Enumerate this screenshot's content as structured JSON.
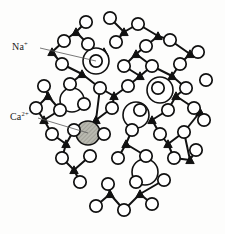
{
  "figure": {
    "type": "structure-diagram",
    "background_color": "#fdfdfc",
    "line_color": "#111111",
    "atom_fill": "#ffffff"
  },
  "labels": [
    {
      "id": "na",
      "text": "Na",
      "charge": "+",
      "full": "Na+",
      "leader_from": [
        40,
        48
      ],
      "leader_to": [
        96,
        61
      ]
    },
    {
      "id": "ca",
      "text": "Ca",
      "charge": "2+",
      "full": "Ca2+",
      "leader_from": [
        38,
        118
      ],
      "leader_to": [
        88,
        133
      ]
    }
  ],
  "legend_species": {
    "oxygen_label": "oxygen",
    "silicon_label": "silicon",
    "sodium_label": "sodium ion",
    "calcium_label": "calcium ion"
  },
  "colors": {
    "sodium_ion_fill": "#ffffff",
    "calcium_ion_fill": "#b9b9b0",
    "silicon_fill": "#111111",
    "oxygen_stroke": "#111111"
  },
  "chart_data": {
    "type": "scatter",
    "title": "",
    "xlabel": "",
    "ylabel": "",
    "oxygen_atoms": [
      [
        86,
        22
      ],
      [
        110,
        18
      ],
      [
        138,
        24
      ],
      [
        64,
        41
      ],
      [
        88,
        44
      ],
      [
        116,
        42
      ],
      [
        146,
        46
      ],
      [
        170,
        40
      ],
      [
        62,
        64
      ],
      [
        96,
        61
      ],
      [
        124,
        66
      ],
      [
        152,
        66
      ],
      [
        180,
        64
      ],
      [
        198,
        52
      ],
      [
        44,
        86
      ],
      [
        70,
        84
      ],
      [
        100,
        88
      ],
      [
        128,
        86
      ],
      [
        158,
        88
      ],
      [
        186,
        88
      ],
      [
        206,
        80
      ],
      [
        36,
        108
      ],
      [
        60,
        110
      ],
      [
        84,
        104
      ],
      [
        112,
        108
      ],
      [
        140,
        110
      ],
      [
        168,
        110
      ],
      [
        194,
        108
      ],
      [
        52,
        134
      ],
      [
        74,
        130
      ],
      [
        104,
        134
      ],
      [
        132,
        130
      ],
      [
        160,
        134
      ],
      [
        184,
        132
      ],
      [
        204,
        120
      ],
      [
        62,
        158
      ],
      [
        90,
        156
      ],
      [
        118,
        158
      ],
      [
        146,
        156
      ],
      [
        174,
        158
      ],
      [
        196,
        150
      ],
      [
        80,
        182
      ],
      [
        108,
        184
      ],
      [
        136,
        182
      ],
      [
        164,
        180
      ],
      [
        96,
        206
      ],
      [
        124,
        210
      ],
      [
        152,
        204
      ]
    ],
    "silicon_nodes": [
      [
        76,
        32
      ],
      [
        124,
        32
      ],
      [
        158,
        36
      ],
      [
        52,
        52
      ],
      [
        104,
        52
      ],
      [
        136,
        54
      ],
      [
        190,
        54
      ],
      [
        82,
        74
      ],
      [
        140,
        76
      ],
      [
        172,
        76
      ],
      [
        48,
        96
      ],
      [
        114,
        96
      ],
      [
        176,
        96
      ],
      [
        44,
        120
      ],
      [
        96,
        120
      ],
      [
        152,
        120
      ],
      [
        200,
        112
      ],
      [
        66,
        144
      ],
      [
        126,
        144
      ],
      [
        168,
        144
      ],
      [
        74,
        170
      ],
      [
        148,
        168
      ],
      [
        190,
        160
      ],
      [
        110,
        194
      ],
      [
        140,
        194
      ]
    ],
    "sodium_ions": [
      {
        "cx": 96,
        "cy": 61,
        "r": 13
      },
      {
        "cx": 72,
        "cy": 100,
        "r": 12
      },
      {
        "cx": 160,
        "cy": 90,
        "r": 13
      },
      {
        "cx": 136,
        "cy": 115,
        "r": 13
      },
      {
        "cx": 145,
        "cy": 172,
        "r": 13
      }
    ],
    "calcium_ions": [
      {
        "cx": 88,
        "cy": 133,
        "r": 12
      }
    ],
    "atom_radius_oxygen": 6.2,
    "grid": false,
    "legend_position": "left"
  }
}
